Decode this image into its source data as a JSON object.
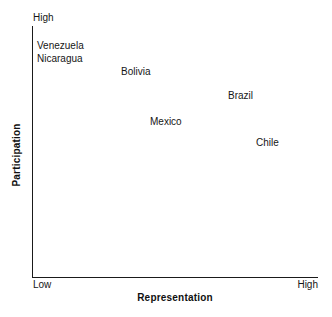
{
  "chart_data": {
    "type": "scatter",
    "title": "",
    "subtitle": "",
    "xlabel": "Representation",
    "ylabel": "Participation",
    "xlim": [
      "Low",
      "High"
    ],
    "ylim": [
      "",
      "High"
    ],
    "x_tick_labels": [
      "Low",
      "High"
    ],
    "y_tick_labels": [
      "High"
    ],
    "grid": false,
    "legend": "none",
    "annotations": "Country names are the plotted marks; no point markers are drawn, only text labels.",
    "points": [
      {
        "label": "Venezuela",
        "x": 0.02,
        "y": 0.94,
        "px": 37,
        "py": 40
      },
      {
        "label": "Nicaragua",
        "x": 0.02,
        "y": 0.89,
        "px": 37,
        "py": 53
      },
      {
        "label": "Bolivia",
        "x": 0.31,
        "y": 0.84,
        "px": 121,
        "py": 66
      },
      {
        "label": "Brazil",
        "x": 0.69,
        "y": 0.74,
        "px": 228,
        "py": 90
      },
      {
        "label": "Mexico",
        "x": 0.42,
        "y": 0.64,
        "px": 150,
        "py": 116
      },
      {
        "label": "Chile",
        "x": 0.78,
        "y": 0.56,
        "px": 256,
        "py": 137
      }
    ]
  },
  "axes": {
    "x_title": "Representation",
    "y_title": "Participation",
    "x_low": "Low",
    "x_high": "High",
    "y_high": "High"
  },
  "colors": {
    "background": "#ffffff",
    "axis": "#1a1a1a",
    "text": "#161616"
  }
}
